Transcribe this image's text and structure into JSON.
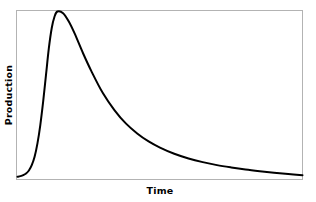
{
  "figure": {
    "background_color": "#ffffff",
    "frame_color": "#b3b3b3",
    "curve_color": "#000000"
  },
  "chart_data": {
    "type": "line",
    "title": "",
    "subtitle": "",
    "xlabel": "Time",
    "ylabel": "Production",
    "grid": false,
    "legend": null,
    "annotations": [],
    "xticks": [],
    "yticks": [],
    "xlim": [
      0,
      1
    ],
    "ylim": [
      0,
      1
    ],
    "series": [
      {
        "name": "Production",
        "color": "#000000",
        "line_width": 2,
        "description": "Rapid rise to an early sharp peak followed by a long exponential decline approaching zero",
        "x": [
          0.0,
          0.01,
          0.02,
          0.03,
          0.04,
          0.05,
          0.06,
          0.07,
          0.08,
          0.09,
          0.1,
          0.11,
          0.12,
          0.13,
          0.14,
          0.16,
          0.18,
          0.2,
          0.23,
          0.26,
          0.3,
          0.34,
          0.38,
          0.42,
          0.46,
          0.5,
          0.55,
          0.6,
          0.65,
          0.7,
          0.75,
          0.8,
          0.85,
          0.9,
          0.95,
          1.0
        ],
        "y": [
          0.01,
          0.014,
          0.02,
          0.03,
          0.048,
          0.08,
          0.13,
          0.21,
          0.32,
          0.46,
          0.62,
          0.78,
          0.9,
          0.97,
          1.0,
          0.99,
          0.94,
          0.87,
          0.75,
          0.64,
          0.51,
          0.41,
          0.33,
          0.27,
          0.222,
          0.185,
          0.148,
          0.12,
          0.098,
          0.08,
          0.066,
          0.054,
          0.044,
          0.035,
          0.027,
          0.02
        ]
      }
    ]
  },
  "labels": {
    "x_axis": "Time",
    "y_axis": "Production"
  }
}
